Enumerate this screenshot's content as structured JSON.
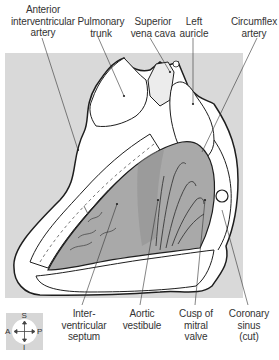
{
  "figure": {
    "background_color": "#d9d9d9",
    "muscle_color": "#a9a9a9",
    "top_labels": [
      {
        "id": "anterior-interventricular-artery",
        "text": "Anterior\ninterventricular\nartery"
      },
      {
        "id": "pulmonary-trunk",
        "text": "Pulmonary\ntrunk"
      },
      {
        "id": "superior-vena-cava",
        "text": "Superior\nvena cava"
      },
      {
        "id": "left-auricle",
        "text": "Left\nauricle"
      },
      {
        "id": "circumflex-artery",
        "text": "Circumflex\nartery"
      }
    ],
    "bottom_labels": [
      {
        "id": "interventricular-septum",
        "text": "Inter-\nventricular\nseptum"
      },
      {
        "id": "aortic-vestibule",
        "text": "Aortic\nvestibule"
      },
      {
        "id": "cusp-of-mitral-valve",
        "text": "Cusp of\nmitral\nvalve"
      },
      {
        "id": "coronary-sinus",
        "text": "Coronary\nsinus\n(cut)"
      }
    ],
    "orientation_compass": {
      "superior": "S",
      "inferior": "I",
      "anterior": "A",
      "posterior": "P"
    }
  }
}
